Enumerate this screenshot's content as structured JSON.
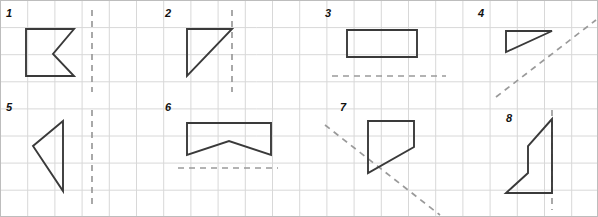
{
  "worksheet": {
    "title": "Symmetry worksheet grid with eight shapes and mirror lines",
    "width": 598,
    "height": 217,
    "background_color": "#ffffff",
    "grid": {
      "cell_width": 27.2,
      "cell_height": 27.1,
      "columns": 22,
      "rows": 8,
      "line_color": "#d8d8d8",
      "border_color": "#bdbdbd",
      "line_width": 1
    },
    "shape_style": {
      "stroke_color": "#3a3a3a",
      "stroke_width": 1.9,
      "fill": "none"
    },
    "mirror_line_style": {
      "stroke_color": "#9a9a9a",
      "stroke_width": 1.7,
      "dash_pattern": "6,5"
    },
    "items": [
      {
        "label": "1",
        "label_x": 6,
        "label_y": 8,
        "shape_name": "arrow-notch-left-polygon",
        "points": "26,29 74,29 53,54 74,76 26,76",
        "closed": true,
        "mirror_name": "vertical-mirror-line",
        "mirror": "92,10 92,92"
      },
      {
        "label": "2",
        "label_x": 165,
        "label_y": 8,
        "shape_name": "right-triangle",
        "points": "187,29 232,29 187,76",
        "closed": true,
        "mirror_name": "vertical-mirror-line",
        "mirror": "232,10 232,92"
      },
      {
        "label": "3",
        "label_x": 325,
        "label_y": 8,
        "shape_name": "rectangle",
        "points": "347,30 417,30 417,57 347,57",
        "closed": true,
        "mirror_name": "horizontal-mirror-line",
        "mirror": "332,76 446,76"
      },
      {
        "label": "4",
        "label_x": 478,
        "label_y": 8,
        "shape_name": "right-triangle",
        "points": "506,31 552,31 506,52",
        "closed": true,
        "mirror_name": "diagonal-mirror-line",
        "mirror": "496,97 596,20"
      },
      {
        "label": "5",
        "label_x": 6,
        "label_y": 102,
        "shape_name": "left-pointing-triangle",
        "points": "63,121 33,146 63,191",
        "closed": true,
        "mirror_name": "vertical-mirror-line",
        "mirror": "92,110 92,205"
      },
      {
        "label": "6",
        "label_x": 165,
        "label_y": 102,
        "shape_name": "banner-chevron-polygon",
        "points": "187,123 271,123 271,155 229,141 187,155",
        "closed": true,
        "mirror_name": "horizontal-mirror-line",
        "mirror": "178,168 278,168"
      },
      {
        "label": "7",
        "label_x": 340,
        "label_y": 102,
        "shape_name": "quadrilateral-trapezoid",
        "points": "368,121 414,121 414,147 368,173",
        "closed": true,
        "mirror_name": "diagonal-mirror-line",
        "mirror": "325,125 440,215"
      },
      {
        "label": "8",
        "label_x": 506,
        "label_y": 113,
        "shape_name": "zigzag-step-polygon",
        "points": "552,119 528,146 528,173 506,193 552,193",
        "closed": true,
        "mirror_name": "vertical-mirror-line",
        "mirror": "552,110 552,210"
      }
    ]
  }
}
